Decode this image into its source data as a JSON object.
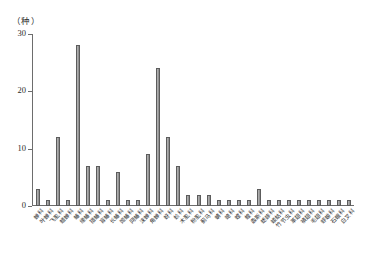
{
  "chart_data": {
    "type": "bar",
    "title": "",
    "subtitle": "",
    "unit_label": "（种）",
    "xlabel": "",
    "ylabel": "种",
    "ylim": [
      0,
      30
    ],
    "yticks": [
      0,
      10,
      20,
      30
    ],
    "ytick_labels": [
      "0",
      "10",
      "20",
      "30"
    ],
    "grid": false,
    "legend": null,
    "bar_color": "#a0a0a0",
    "bar_edge_color": "#5c5c5c",
    "axis_color": "#6d6d6d",
    "categories": [
      "蝉科",
      "叶蝉科",
      "飞虱科",
      "蜡蝉科",
      "蝽科",
      "缘蝽科",
      "猎蝽科",
      "盲蝽科",
      "长蝽科",
      "姬蝽科",
      "网蝽科",
      "沫蝉科",
      "角蝉科",
      "蚜科",
      "蚧科",
      "木虱科",
      "粉虱科",
      "蓟马科",
      "蜻科",
      "蟌科",
      "螳科",
      "蝗科",
      "螽斯科",
      "蟋蟀科",
      "蝼蛄科",
      "竹节虫科",
      "革翅科",
      "襀翅科",
      "毛翅科",
      "蜉蝣科",
      "石蛾科",
      "白叉科"
    ],
    "values": [
      3,
      1,
      12,
      1,
      28,
      7,
      7,
      1,
      6,
      1,
      1,
      9,
      24,
      12,
      7,
      2,
      2,
      2,
      1,
      1,
      1,
      1,
      3,
      1,
      1,
      1,
      1,
      1,
      1,
      1,
      1,
      1
    ]
  }
}
